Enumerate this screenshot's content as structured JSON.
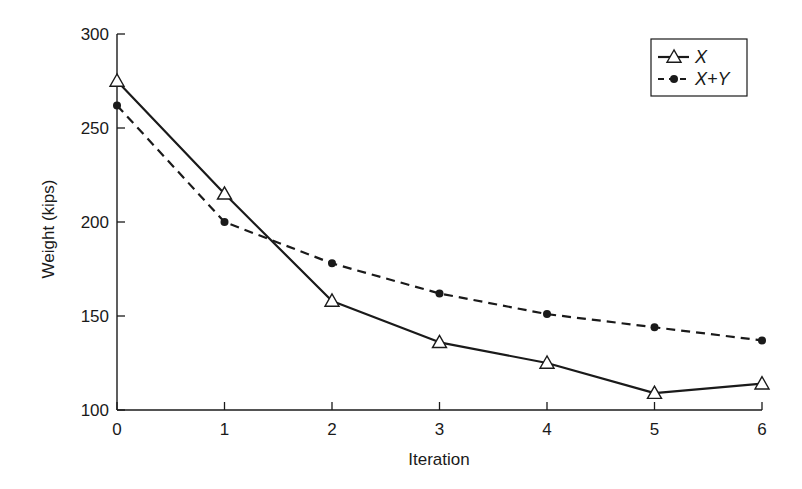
{
  "chart_data": {
    "type": "line",
    "title": "",
    "xlabel": "Iteration",
    "ylabel": "Weight (kips)",
    "x": [
      0,
      1,
      2,
      3,
      4,
      5,
      6
    ],
    "xlim": [
      0,
      6
    ],
    "ylim": [
      100,
      300
    ],
    "xticks": [
      "0",
      "1",
      "2",
      "3",
      "4",
      "5",
      "6"
    ],
    "yticks": [
      "100",
      "150",
      "200",
      "250",
      "300"
    ],
    "grid": false,
    "legend_position": "upper right",
    "series": [
      {
        "name": "X",
        "style": "solid",
        "marker": "open-triangle",
        "color": "#1a1a1a",
        "values": [
          275,
          215,
          158,
          136,
          125,
          109,
          114
        ]
      },
      {
        "name": "X+Y",
        "style": "dashed",
        "marker": "filled-circle",
        "color": "#1a1a1a",
        "values": [
          262,
          200,
          178,
          162,
          151,
          144,
          137
        ]
      }
    ]
  }
}
